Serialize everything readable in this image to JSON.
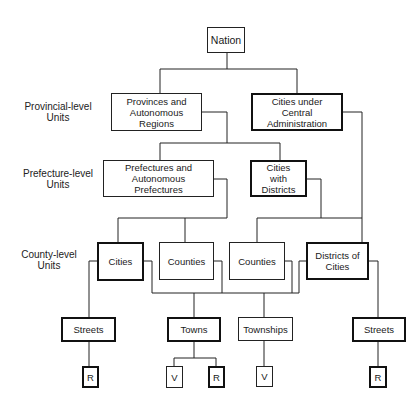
{
  "levels": {
    "provincial": "Provincial-level Units",
    "prefecture": "Prefecture-level Units",
    "county": "County-level Units"
  },
  "nodes": {
    "nation": "Nation",
    "provinces": "Provinces and Autonomous Regions",
    "central_cities": "Cities under Central Administration",
    "prefectures": "Prefectures and Autonomous Prefectures",
    "cities_with_districts": "Cities with Districts",
    "cities": "Cities",
    "counties_1": "Counties",
    "counties_2": "Counties",
    "districts_of_cities": "Districts of Cities",
    "streets_1": "Streets",
    "towns": "Towns",
    "townships": "Townships",
    "streets_2": "Streets",
    "r_1": "R",
    "v_1": "V",
    "r_2": "R",
    "v_2": "V",
    "r_3": "R"
  }
}
